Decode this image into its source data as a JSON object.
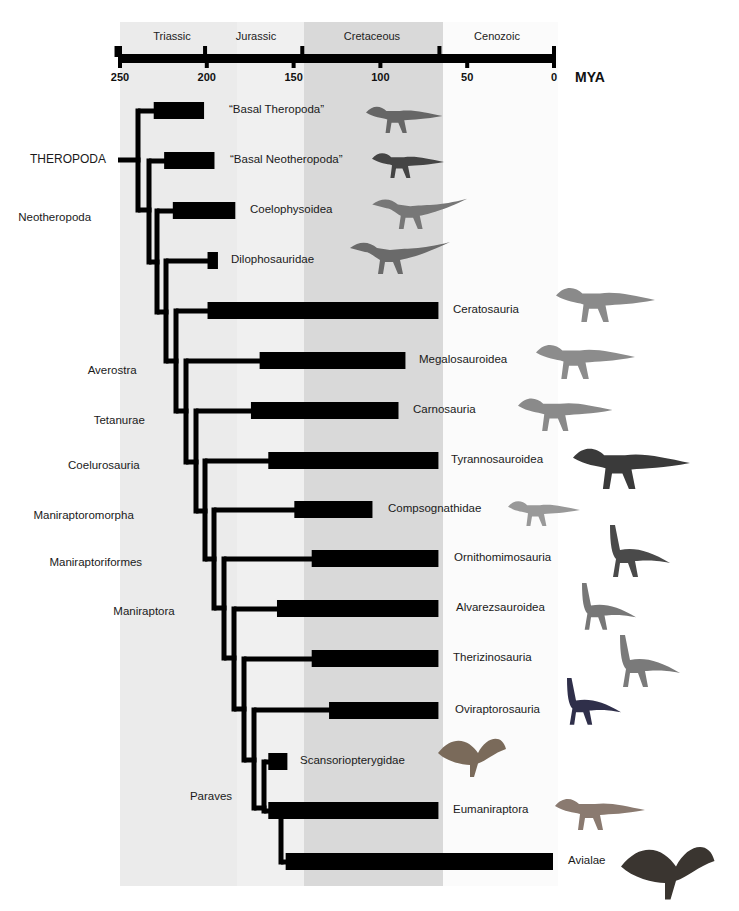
{
  "figure": {
    "axis": {
      "unit_label": "MYA",
      "ticks": [
        250,
        200,
        150,
        100,
        50,
        0
      ],
      "x_at_250": 119,
      "x_at_0": 553,
      "periods": [
        {
          "name": "Triassic",
          "start": 252,
          "end": 201,
          "label_x": 172
        },
        {
          "name": "Jurassic",
          "start": 201,
          "end": 145,
          "label_x": 256
        },
        {
          "name": "Cretaceous",
          "start": 145,
          "end": 66,
          "label_x": 372
        },
        {
          "name": "Cenozoic",
          "start": 66,
          "end": 0,
          "label_x": 497
        }
      ]
    },
    "background_bands": [
      {
        "x": 120,
        "w": 117,
        "color": "#ebebeb"
      },
      {
        "x": 237,
        "w": 67,
        "color": "#f0f0f0"
      },
      {
        "x": 304,
        "w": 139,
        "color": "#d9d9d9"
      },
      {
        "x": 443,
        "w": 115,
        "color": "#fbfbfb"
      }
    ],
    "root_label": "THEROPODA",
    "node_labels": [
      {
        "name": "Neotheropoda",
        "x": 56,
        "y": 218
      },
      {
        "name": "Averostra",
        "x": 116,
        "y": 371
      },
      {
        "name": "Tetanurae",
        "x": 122,
        "y": 421
      },
      {
        "name": "Coelurosauria",
        "x": 109,
        "y": 466
      },
      {
        "name": "Maniraptoromorpha",
        "x": 87,
        "y": 516
      },
      {
        "name": "Maniraptoriformes",
        "x": 103,
        "y": 563
      },
      {
        "name": "Maniraptora",
        "x": 148,
        "y": 612
      },
      {
        "name": "Paraves",
        "x": 212,
        "y": 797
      }
    ],
    "clades": [
      {
        "name": "“Basal Theropoda”",
        "start_mya": 230,
        "end_mya": 201,
        "y": 111,
        "label_x": 229,
        "image": "basal-theropod"
      },
      {
        "name": "“Basal Neotheropoda”",
        "start_mya": 224,
        "end_mya": 195,
        "y": 161,
        "label_x": 230,
        "image": "basal-neotheropod"
      },
      {
        "name": "Coelophysoidea",
        "start_mya": 219,
        "end_mya": 183,
        "y": 211,
        "label_x": 250,
        "image": "coelophysoid"
      },
      {
        "name": "Dilophosauridae",
        "start_mya": 199,
        "end_mya": 193,
        "y": 261,
        "label_x": 231,
        "image": "dilophosaur"
      },
      {
        "name": "Ceratosauria",
        "start_mya": 199,
        "end_mya": 66,
        "y": 311,
        "label_x": 453,
        "image": "ceratosaur"
      },
      {
        "name": "Megalosauroidea",
        "start_mya": 169,
        "end_mya": 85,
        "y": 361,
        "label_x": 419,
        "image": "megalosaur"
      },
      {
        "name": "Carnosauria",
        "start_mya": 174,
        "end_mya": 89,
        "y": 411,
        "label_x": 413,
        "image": "carnosaur"
      },
      {
        "name": "Tyrannosauroidea",
        "start_mya": 164,
        "end_mya": 66,
        "y": 461,
        "label_x": 451,
        "image": "tyrannosaur"
      },
      {
        "name": "Compsognathidae",
        "start_mya": 149,
        "end_mya": 104,
        "y": 510,
        "label_x": 388,
        "image": "compsognathid"
      },
      {
        "name": "Ornithomimosauria",
        "start_mya": 139,
        "end_mya": 66,
        "y": 559,
        "label_x": 454,
        "image": "ornithomimosaur"
      },
      {
        "name": "Alvarezsauroidea",
        "start_mya": 159,
        "end_mya": 66,
        "y": 609,
        "label_x": 456,
        "image": "alvarezsaur"
      },
      {
        "name": "Therizinosauria",
        "start_mya": 139,
        "end_mya": 66,
        "y": 659,
        "label_x": 453,
        "image": "therizinosaur"
      },
      {
        "name": "Oviraptorosauria",
        "start_mya": 129,
        "end_mya": 66,
        "y": 711,
        "label_x": 455,
        "image": "oviraptorosaur"
      },
      {
        "name": "Scansoriopterygidae",
        "start_mya": 164,
        "end_mya": 153,
        "y": 762,
        "label_x": 300,
        "image": "scansoriopterygid"
      },
      {
        "name": "Eumaniraptora",
        "start_mya": 164,
        "end_mya": 66,
        "y": 811,
        "label_x": 453,
        "image": "dromaeosaur"
      },
      {
        "name": "Avialae",
        "start_mya": 154,
        "end_mya": 0,
        "y": 862,
        "label_x": 568,
        "image": "bird"
      }
    ]
  },
  "chart_data": {
    "type": "bar",
    "xlabel": "MYA",
    "xlim": [
      250,
      0
    ],
    "ticks": [
      250,
      200,
      150,
      100,
      50,
      0
    ],
    "periods": [
      "Triassic",
      "Jurassic",
      "Cretaceous",
      "Cenozoic"
    ],
    "categories": [
      "“Basal Theropoda”",
      "“Basal Neotheropoda”",
      "Coelophysoidea",
      "Dilophosauridae",
      "Ceratosauria",
      "Megalosauroidea",
      "Carnosauria",
      "Tyrannosauroidea",
      "Compsognathidae",
      "Ornithomimosauria",
      "Alvarezsauroidea",
      "Therizinosauria",
      "Oviraptorosauria",
      "Scansoriopterygidae",
      "Eumaniraptora",
      "Avialae"
    ],
    "ranges_mya": [
      [
        230,
        201
      ],
      [
        224,
        195
      ],
      [
        219,
        183
      ],
      [
        199,
        193
      ],
      [
        199,
        66
      ],
      [
        169,
        85
      ],
      [
        174,
        89
      ],
      [
        164,
        66
      ],
      [
        149,
        104
      ],
      [
        139,
        66
      ],
      [
        159,
        66
      ],
      [
        139,
        66
      ],
      [
        129,
        66
      ],
      [
        164,
        153
      ],
      [
        164,
        66
      ],
      [
        154,
        0
      ]
    ],
    "node_labels": [
      "THEROPODA",
      "Neotheropoda",
      "Averostra",
      "Tetanurae",
      "Coelurosauria",
      "Maniraptoromorpha",
      "Maniraptoriformes",
      "Maniraptora",
      "Paraves"
    ]
  }
}
